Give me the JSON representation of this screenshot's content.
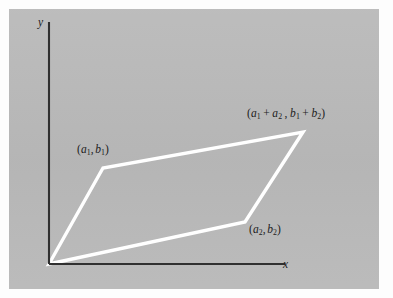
{
  "figure": {
    "kind": "geometry-diagram",
    "panel_color": "#b9b9b9",
    "page_color": "#fdfdfd",
    "axis_color": "#303030",
    "shape_color": "#ffffff",
    "text_color": "#1c1c1c"
  },
  "axes": {
    "y_label": "y",
    "x_label": "x",
    "origin": {
      "x": 49,
      "y": 264
    },
    "y_top": {
      "x": 49,
      "y": 22
    },
    "x_right": {
      "x": 285,
      "y": 264
    }
  },
  "vertices": {
    "origin": {
      "x": 49,
      "y": 264
    },
    "v1": {
      "x": 103,
      "y": 168
    },
    "v2": {
      "x": 245,
      "y": 222
    },
    "sum": {
      "x": 303,
      "y": 132
    }
  },
  "labels": {
    "v1": {
      "open": "(",
      "letter_a": "a",
      "sub_a": "1",
      "comma": ",",
      "letter_b": "b",
      "sub_b": "1",
      "close": ")"
    },
    "v2": {
      "open": "(",
      "letter_a": "a",
      "sub_a": "2",
      "comma": ",",
      "letter_b": "b",
      "sub_b": "2",
      "close": ")"
    },
    "sum": {
      "open": "(",
      "letter_a1": "a",
      "sub_a1": "1",
      "plus_a": "+",
      "letter_a2": "a",
      "sub_a2": "2",
      "comma": ",",
      "letter_b1": "b",
      "sub_b1": "1",
      "plus_b": "+",
      "letter_b2": "b",
      "sub_b2": "2",
      "close": ")"
    }
  }
}
